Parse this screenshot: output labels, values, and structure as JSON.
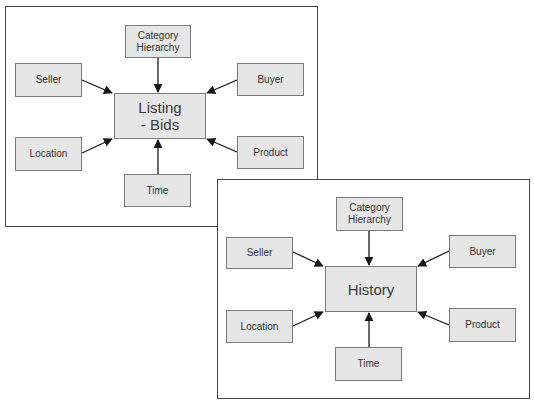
{
  "diagrams": [
    {
      "name": "listing-bids",
      "panel": {
        "x": 5,
        "y": 6,
        "w": 313,
        "h": 221
      },
      "center": {
        "label": "Listing\n- Bids",
        "x": 114,
        "y": 93,
        "w": 92,
        "h": 46
      },
      "nodes": [
        {
          "id": "category-hierarchy",
          "label": "Category\nHierarchy",
          "x": 125,
          "y": 25,
          "w": 66,
          "h": 33
        },
        {
          "id": "seller",
          "label": "Seller",
          "x": 15,
          "y": 63,
          "w": 67,
          "h": 34
        },
        {
          "id": "buyer",
          "label": "Buyer",
          "x": 237,
          "y": 63,
          "w": 67,
          "h": 33
        },
        {
          "id": "location",
          "label": "Location",
          "x": 15,
          "y": 137,
          "w": 67,
          "h": 34
        },
        {
          "id": "product",
          "label": "Product",
          "x": 237,
          "y": 136,
          "w": 67,
          "h": 33
        },
        {
          "id": "time",
          "label": "Time",
          "x": 124,
          "y": 174,
          "w": 67,
          "h": 33
        }
      ]
    },
    {
      "name": "history",
      "panel": {
        "x": 217,
        "y": 179,
        "w": 313,
        "h": 220
      },
      "center": {
        "label": "History",
        "x": 325,
        "y": 266,
        "w": 92,
        "h": 46
      },
      "nodes": [
        {
          "id": "category-hierarchy",
          "label": "Category\nHierarchy",
          "x": 336,
          "y": 197,
          "w": 67,
          "h": 34
        },
        {
          "id": "seller",
          "label": "Seller",
          "x": 226,
          "y": 237,
          "w": 67,
          "h": 32
        },
        {
          "id": "buyer",
          "label": "Buyer",
          "x": 449,
          "y": 235,
          "w": 67,
          "h": 33
        },
        {
          "id": "location",
          "label": "Location",
          "x": 226,
          "y": 310,
          "w": 67,
          "h": 33
        },
        {
          "id": "product",
          "label": "Product",
          "x": 449,
          "y": 308,
          "w": 67,
          "h": 34
        },
        {
          "id": "time",
          "label": "Time",
          "x": 335,
          "y": 347,
          "w": 67,
          "h": 34
        }
      ]
    }
  ],
  "colors": {
    "node_fill": "#e6e6e6",
    "node_border": "#7a7a7a",
    "panel_border": "#444444",
    "arrow": "#1a1a1a",
    "text": "#333333"
  }
}
